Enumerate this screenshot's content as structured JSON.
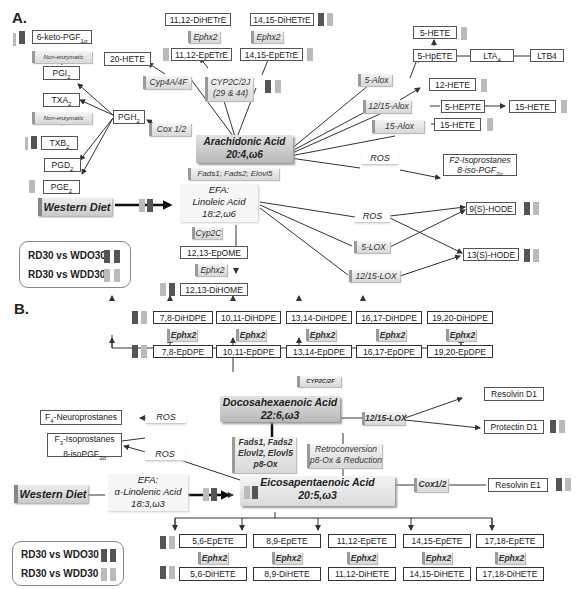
{
  "panelA": {
    "label": "A.",
    "hub": {
      "name": "Arachidonic Acid",
      "formula": "20:4,ω6"
    },
    "efa": {
      "line1": "EFA:",
      "line2": "Linoleic Acid",
      "line3": "18:2,ω6"
    },
    "western_diet": "Western Diet",
    "enzymes": {
      "fads": "Fads1; Fads2; Elovl5",
      "cyp4a": "Cyp4A/4F",
      "cyp2c2j_1": "CYP2C/2J",
      "cyp2c2j_2": "(29 & 44)",
      "cox": "Cox 1/2",
      "alox5": "5-Alox",
      "alox1215": "12/15-Alox",
      "alox15": "15-Alox",
      "ros1": "ROS",
      "ros2": "ROS",
      "lox5": "5-LOX",
      "lox1215": "12/15-LOX",
      "cyp2c": "Cyp2C",
      "ephx2_a": "Ephx2",
      "ephx2_b": "Ephx2",
      "ephx2_c": "Ephx2",
      "nonenz1": "Non-enzymatic",
      "nonenz2": "Non-enzymatic"
    },
    "metabolites": {
      "keto": "6-keto-PGF",
      "keto_sub": "1α",
      "pgi2": "PGI",
      "txa2": "TXA",
      "txb2": "TXB",
      "pgd2": "PGD",
      "pge2": "PGE",
      "pgh2": "PGH",
      "sub2": "2",
      "hete20": "20-HETE",
      "dihetre1112": "11,12-DiHETrE",
      "epetre1112": "11,12-EpETrE",
      "dihetre1415": "14,15-DiHETrE",
      "epetre1415": "14,15-EpETrE",
      "hete5": "5-HETE",
      "hpete5": "5-HpETE",
      "lta4": "LTA",
      "lta4_sub": "4",
      "ltb4": "LTB4",
      "hete12": "12-HETE",
      "hepte5": "5-HEPTE",
      "hete15a": "15-HETE",
      "hete15b": "15-HETE",
      "f2iso1": "F2-Isoprostanes",
      "f2iso2": "8-iso-PGF",
      "f2iso_sub": "2α",
      "hode9": "9(S)-HODE",
      "hode13": "13(S)-HODE",
      "epome": "12,13-EpOME",
      "dihome": "12,13-DiHOME"
    },
    "legend": {
      "row1": "RD30 vs WDO30",
      "row2": "RD30 vs WDD30"
    }
  },
  "panelB": {
    "label": "B.",
    "dha": {
      "name": "Docosahexaenoic Acid",
      "formula": "22:6,ω3"
    },
    "epa": {
      "name": "Eicosapentaenoic Acid",
      "formula": "20:5,ω3"
    },
    "efa": {
      "line1": "EFA:",
      "line2": "α-Linolenic Acid",
      "line3": "18:3,ω3"
    },
    "western_diet": "Western Diet",
    "enzymes": {
      "cyp2c2f": "CYP2C/2F",
      "lox1215": "12/15-LOX",
      "fads1": "Fads1, Fads2",
      "fads2": "Elovl2, Elovl5",
      "fads3": "p8-Ox",
      "retro1": "Retroconversion",
      "retro2": "p8-Ox & Reduction",
      "cox": "Cox1/2",
      "ros1": "ROS",
      "ros2": "ROS",
      "ephx2": "Ephx2"
    },
    "dihdpe": [
      "7,8-DiHDPE",
      "10,11-DiHDPE",
      "13,14-DiHDPE",
      "16,17-DiHDPE",
      "19,20-DiHDPE"
    ],
    "epdpe": [
      "7,8-EpDPE",
      "10,11-EpDPE",
      "13,14-EpDPE",
      "16,17-EpDPE",
      "19,20-EpDPE"
    ],
    "epete": [
      "5,6-EpETE",
      "8,9-EpETE",
      "11,12-EpETE",
      "14,15-EpETE",
      "17,18-EpETE"
    ],
    "dihete": [
      "5,6-DiHETE",
      "8,9-DiHETE",
      "11,12-DiHETE",
      "14,15-DiHETE",
      "17,18-DiHETE"
    ],
    "resolvin_d1": "Resolvin D1",
    "protectin_d1": "Protectin D1",
    "resolvin_e1": "Resolvin E1",
    "f4neuro": "F",
    "f4neuro_sub": "4",
    "f4neuro_rest": "-Neuroprostanes",
    "f3iso1": "F",
    "f3iso1_sub": "3",
    "f3iso1_rest": "-Isoprostanes",
    "f3iso2": "8-isoPGF",
    "f3iso2_sub": "3α",
    "legend": {
      "row1": "RD30 vs WDO30",
      "row2": "RD30 vs WDD30"
    }
  },
  "colors": {
    "dark_arrow": "#555555",
    "light_arrow": "#bbbbbb",
    "hub_bg": "#c4c4c4"
  }
}
